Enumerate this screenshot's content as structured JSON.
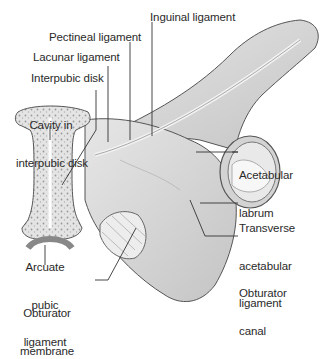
{
  "figure": {
    "labels": {
      "inguinal_ligament": "Inguinal ligament",
      "pectineal_ligament": "Pectineal ligament",
      "lacunar_ligament": "Lacunar ligament",
      "interpubic_disk": "Interpubic disk",
      "cavity_line1": "Cavity in",
      "cavity_line2": "interpubic disk",
      "acetabular_labrum_line1": "Acetabular",
      "acetabular_labrum_line2": "labrum",
      "transverse_line1": "Transverse",
      "transverse_line2": "acetabular",
      "transverse_line3": "ligament",
      "obturator_canal_line1": "Obturator",
      "obturator_canal_line2": "canal",
      "arcuate_line1": "Arcuate",
      "arcuate_line2": "pubic",
      "arcuate_line3": "ligament",
      "obturator_membrane_line1": "Obturator",
      "obturator_membrane_line2": "membrane"
    },
    "colors": {
      "bone": "#d9d9d9",
      "bone_shadow": "#bdbdbd",
      "outline": "#555555",
      "leader": "#333333",
      "ligament": "#efefef"
    }
  }
}
